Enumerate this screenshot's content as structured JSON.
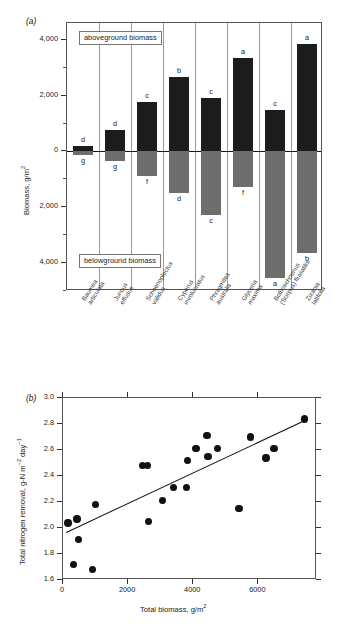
{
  "figure": {
    "panel_a_letter": "(a)",
    "panel_b_letter": "(b)"
  },
  "chart_data": [
    {
      "id": "panel_a",
      "type": "bar",
      "title": "",
      "xlabel": "",
      "ylabel": "Biomass, g/m2",
      "ylabel_display": "Biomass, g/m",
      "ylabel_sup": "2",
      "ylim": [
        -5000,
        4600
      ],
      "yticks": [
        4000,
        2000,
        0,
        2000,
        4000
      ],
      "ytick_labels": [
        "4,000",
        "2,000",
        "0",
        "2,000",
        "4,000"
      ],
      "grid": false,
      "orientation": "diverging",
      "annotations": {
        "above_box": "aboveground biomass",
        "below_box": "belowground biomass"
      },
      "categories": [
        "Baumea articulata",
        "Juncus effusus",
        "Schoenoplectus validus",
        "Cyperus involucratus",
        "Phragmites australis",
        "Glyceria maxima",
        "Bolboschoenus (Scirpus) fluviatilis",
        "Zizania latifolia"
      ],
      "category_lines": [
        [
          "Baumea",
          "articulata"
        ],
        [
          "Juncus",
          "effusus"
        ],
        [
          "Schoenoplectus",
          "validus"
        ],
        [
          "Cyperus",
          "involucratus"
        ],
        [
          "Phragmites",
          "australis"
        ],
        [
          "Glyceria",
          "maxima"
        ],
        [
          "Bolboschoenus",
          "(Scirpus) fluviatilis"
        ],
        [
          "Zizania",
          "latifolia"
        ]
      ],
      "series": [
        {
          "name": "aboveground biomass",
          "color": "#1c1c1c",
          "values": [
            180,
            760,
            1760,
            2680,
            1920,
            3340,
            1500,
            3840
          ],
          "sig_letters": [
            "d",
            "d",
            "c",
            "b",
            "c",
            "a",
            "c",
            "a"
          ]
        },
        {
          "name": "belowground biomass",
          "color": "#6e6e6e",
          "values": [
            -130,
            -330,
            -890,
            -1500,
            -2280,
            -1290,
            -4520,
            -3650
          ],
          "sig_letters": [
            "g",
            "g",
            "f",
            "d",
            "c",
            "f",
            "a",
            "b"
          ]
        }
      ]
    },
    {
      "id": "panel_b",
      "type": "scatter",
      "title": "",
      "xlabel_display": "Total biomass, g/m",
      "xlabel_sup": "2",
      "xlabel": "Total biomass, g/m2",
      "ylabel": "Total nitrogen removal, g-N m-2 day-1",
      "ylabel_parts": [
        "Total nitrogen removal, g-N m",
        "−2",
        " day",
        "−1"
      ],
      "xlim": [
        0,
        7800
      ],
      "ylim": [
        1.6,
        3.0
      ],
      "xticks": [
        0,
        2000,
        4000,
        6000
      ],
      "xtick_labels": [
        "0",
        "2000",
        "4000",
        "6000"
      ],
      "yticks": [
        1.6,
        1.8,
        2.0,
        2.2,
        2.4,
        2.6,
        2.8,
        3.0
      ],
      "ytick_labels": [
        "1.6",
        "1.8",
        "2.0",
        "2.2",
        "2.4",
        "2.6",
        "2.8",
        "3.0"
      ],
      "grid": false,
      "marker_color": "#111111",
      "points": [
        {
          "x": 150,
          "y": 2.04
        },
        {
          "x": 330,
          "y": 1.72
        },
        {
          "x": 430,
          "y": 2.07
        },
        {
          "x": 470,
          "y": 1.91
        },
        {
          "x": 900,
          "y": 1.68
        },
        {
          "x": 1000,
          "y": 2.18
        },
        {
          "x": 2450,
          "y": 2.48
        },
        {
          "x": 2600,
          "y": 2.48
        },
        {
          "x": 2620,
          "y": 2.05
        },
        {
          "x": 3060,
          "y": 2.21
        },
        {
          "x": 3400,
          "y": 2.31
        },
        {
          "x": 3800,
          "y": 2.31
        },
        {
          "x": 3830,
          "y": 2.52
        },
        {
          "x": 4080,
          "y": 2.61
        },
        {
          "x": 4420,
          "y": 2.71
        },
        {
          "x": 4450,
          "y": 2.55
        },
        {
          "x": 4740,
          "y": 2.61
        },
        {
          "x": 5400,
          "y": 2.15
        },
        {
          "x": 5760,
          "y": 2.7
        },
        {
          "x": 6230,
          "y": 2.54
        },
        {
          "x": 6480,
          "y": 2.61
        },
        {
          "x": 7420,
          "y": 2.84
        }
      ],
      "trendline": {
        "x0": 100,
        "y0": 1.97,
        "x1": 7420,
        "y1": 2.83
      }
    }
  ]
}
